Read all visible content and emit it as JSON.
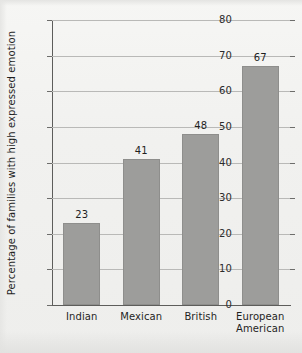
{
  "chart_data": {
    "type": "bar",
    "title": "",
    "xlabel": "",
    "ylabel": "Percentage of families with high expressed emotion",
    "categories": [
      "Indian",
      "Mexican",
      "British",
      "European American"
    ],
    "category_lines": [
      [
        "Indian"
      ],
      [
        "Mexican"
      ],
      [
        "British"
      ],
      [
        "European",
        "American"
      ]
    ],
    "values": [
      23,
      41,
      48,
      67
    ],
    "value_labels": [
      "23",
      "41",
      "48",
      "67"
    ],
    "ylim": [
      0,
      80
    ],
    "yticks": [
      0,
      10,
      20,
      30,
      40,
      50,
      60,
      70,
      80
    ],
    "ytick_labels": [
      "0",
      "10",
      "20",
      "30",
      "40",
      "50",
      "60",
      "70",
      "80"
    ],
    "grid": true,
    "grid_axis": "y",
    "legend": false,
    "legend_position": "none",
    "bar_color": "#9d9d9b",
    "grid_color": "#b9b9b7",
    "axis_color": "#5d5d5b",
    "background_color": "#f2f2f0"
  }
}
